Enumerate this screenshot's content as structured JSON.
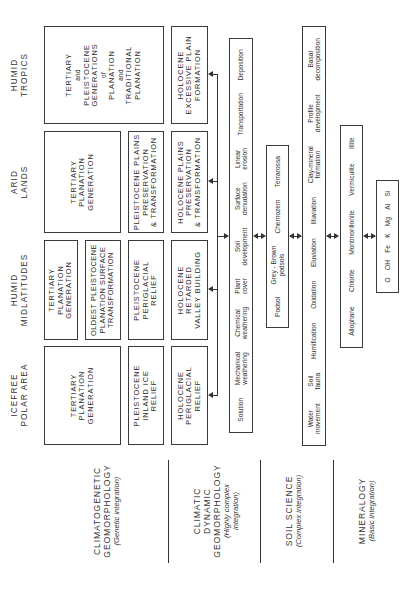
{
  "climate_zones": [
    {
      "id": "icefree",
      "label_lines": [
        "ICEFREE",
        "POLAR AREA"
      ]
    },
    {
      "id": "midlatitudes",
      "label_lines": [
        "HUMID",
        "MIDLATITUDES"
      ]
    },
    {
      "id": "arid",
      "label_lines": [
        "ARID",
        "LANDS"
      ]
    },
    {
      "id": "tropics",
      "label_lines": [
        "HUMID",
        "TROPICS"
      ]
    }
  ],
  "genetic_boxes": {
    "icefree": {
      "tertiary": [
        "TERTIARY",
        "PLANATION",
        "GENERATION"
      ],
      "pleistocene": [
        "PLEISTOCENE",
        "INLAND ICE",
        "RELIEF"
      ],
      "holocene": [
        "HOLOCENE",
        "PERIGLACIAL",
        "RELIEF"
      ]
    },
    "midlatitudes": {
      "tertiary": [
        "TERTIARY",
        "PLANATION",
        "GENERATION"
      ],
      "oldest_pleistocene": [
        "OLDEST PLEISTOCENE",
        "PLANATION SURFACE",
        "TRANSFORMATION"
      ],
      "pleistocene": [
        "PLEISTOCENE",
        "PERIGLACIAL",
        "RELIEF"
      ],
      "holocene": [
        "HOLOCENE",
        "RETARDED",
        "VALLEY BUILDING"
      ]
    },
    "arid": {
      "tertiary": [
        "TERTIARY",
        "PLANATION",
        "GENERATION"
      ],
      "pleistocene": [
        "PLEISTOCENE PLAINS",
        "PRESERVATION",
        "& TRANSFORMATION"
      ],
      "holocene": [
        "HOLOCENE PLAINS",
        "PRESERVATION",
        "& TRANSFORMATION"
      ]
    },
    "tropics": {
      "tertiary_pleistocene": [
        "TERTIARY",
        "and",
        "PLEISTOCENE",
        "GENERATIONS",
        "of",
        "PLANATION",
        "and",
        "TRADITIONAL",
        "PLANATION"
      ],
      "holocene": [
        "HOLOCENE",
        "EXCESSIVE PLAIN",
        "FORMATION"
      ]
    }
  },
  "dynamic_processes": [
    [
      "Solution"
    ],
    [
      "Mechanical",
      "weathering"
    ],
    [
      "Chemical",
      "weathering"
    ],
    [
      "Plant",
      "cover"
    ],
    [
      "Soil",
      "development"
    ],
    [
      "Surface",
      "denudation"
    ],
    [
      "Linear",
      "erosion"
    ],
    [
      "Transportation"
    ],
    [
      "Deposition"
    ]
  ],
  "soil_types": [
    [
      "Podsol"
    ],
    [
      "Grey - Brown",
      "podsols"
    ],
    [
      "Chernozem"
    ],
    [
      "Terrarossa"
    ]
  ],
  "soil_processes": [
    [
      "Water",
      "movement"
    ],
    [
      "Soil",
      "fauna"
    ],
    [
      "Humification"
    ],
    [
      "Oxidation"
    ],
    [
      "Eluviation"
    ],
    [
      "Illuviation"
    ],
    [
      "Clay-mineral",
      "formation"
    ],
    [
      "Profile",
      "development"
    ],
    [
      "Basal",
      "decomposition"
    ]
  ],
  "clay_minerals": [
    "Allophane",
    "Chlorite",
    "Montmorillonite",
    "Vermiculite",
    "Illite"
  ],
  "elements": [
    "O",
    "OH",
    "Fe",
    "K",
    "Mg",
    "Al",
    "Si"
  ],
  "disciplines": [
    {
      "title_lines": [
        "CLIMATOGENETIC",
        "GEOMORPHOLOGY"
      ],
      "subtitle_lines": [
        "(Genetic integration)"
      ]
    },
    {
      "title_lines": [
        "CLIMATIC",
        "DYNAMIC",
        "GEOMORPHOLOGY"
      ],
      "subtitle_lines": [
        "(Highly complex",
        "integration)"
      ]
    },
    {
      "title_lines": [
        "SOIL SCIENCE"
      ],
      "subtitle_lines": [
        "(Complex integration)"
      ]
    },
    {
      "title_lines": [
        "MINERALOGY"
      ],
      "subtitle_lines": [
        "(Basic integration)"
      ]
    }
  ]
}
